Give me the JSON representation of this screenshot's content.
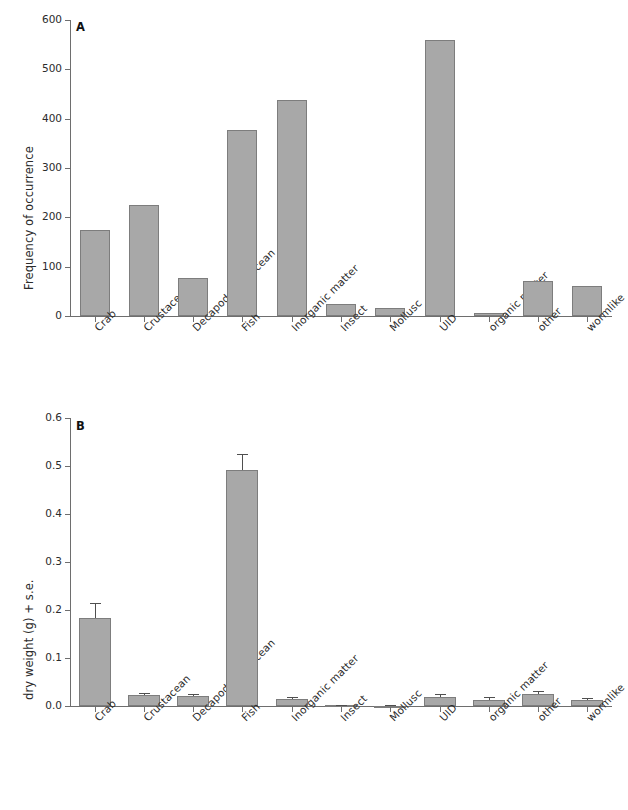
{
  "figure": {
    "panels": [
      "A",
      "B"
    ],
    "bar_color": "#a8a8a8",
    "bar_edge_color": "#7d7d7d",
    "axis_color": "#6e6e6e",
    "error_bar_color": "#4f4f4f",
    "background": "#ffffff"
  },
  "panel_a": {
    "letter": "A",
    "ylabel": "Frequency of occurrence",
    "yticks": [
      "600",
      "500",
      "400",
      "300",
      "200",
      "100",
      "0"
    ],
    "xlabels": [
      "Crab",
      "Crustacean",
      "Decapod Crustacean",
      "Fish",
      "Inorganic matter",
      "Insect",
      "Mollusc",
      "UID",
      "organic matter",
      "other",
      "wormlike"
    ]
  },
  "panel_b": {
    "letter": "B",
    "ylabel": "dry weight (g) + s.e.",
    "yticks": [
      "0.6",
      "0.5",
      "0.4",
      "0.3",
      "0.2",
      "0.1",
      "0.0"
    ],
    "xlabels": [
      "Crab",
      "Crustacean",
      "Decapod Crustacean",
      "Fish",
      "Inorganic matter",
      "Insect",
      "Mollusc",
      "UID",
      "organic matter",
      "other",
      "wormlike"
    ]
  },
  "chart_data": [
    {
      "type": "bar",
      "panel": "A",
      "title": "",
      "xlabel": "",
      "ylabel": "Frequency of occurrence",
      "ylim": [
        0,
        600
      ],
      "yticks": [
        0,
        100,
        200,
        300,
        400,
        500,
        600
      ],
      "grid": false,
      "legend": "none",
      "categories": [
        "Crab",
        "Crustacean",
        "Decapod Crustacean",
        "Fish",
        "Inorganic matter",
        "Insect",
        "Mollusc",
        "UID",
        "organic matter",
        "other",
        "wormlike"
      ],
      "values": [
        175,
        225,
        77,
        378,
        437,
        25,
        17,
        560,
        7,
        70,
        60
      ]
    },
    {
      "type": "bar",
      "panel": "B",
      "title": "",
      "xlabel": "",
      "ylabel": "dry weight (g) + s.e.",
      "ylim": [
        0.0,
        0.6
      ],
      "yticks": [
        0.0,
        0.1,
        0.2,
        0.3,
        0.4,
        0.5,
        0.6
      ],
      "grid": false,
      "legend": "none",
      "categories": [
        "Crab",
        "Crustacean",
        "Decapod Crustacean",
        "Fish",
        "Inorganic matter",
        "Insect",
        "Mollusc",
        "UID",
        "organic matter",
        "other",
        "wormlike"
      ],
      "values": [
        0.183,
        0.023,
        0.021,
        0.491,
        0.014,
        0.002,
        0.001,
        0.019,
        0.013,
        0.026,
        0.013
      ],
      "errors": [
        0.032,
        0.004,
        0.005,
        0.035,
        0.004,
        0.001,
        0.001,
        0.005,
        0.006,
        0.005,
        0.004
      ]
    }
  ]
}
